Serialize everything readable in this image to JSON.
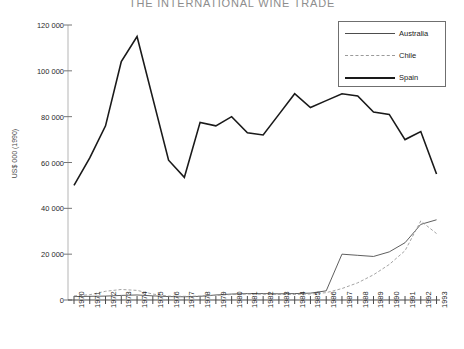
{
  "chart_data": {
    "type": "line",
    "title": "THE INTERNATIONAL WINE TRADE",
    "xlabel": "",
    "ylabel": "US$ 000 (1990)",
    "ylim": [
      0,
      120000
    ],
    "yticks": [
      0,
      20000,
      40000,
      60000,
      80000,
      100000,
      120000
    ],
    "ytick_labels": [
      "0",
      "20 000",
      "40 000",
      "60 000",
      "80 000",
      "100 000",
      "120 000"
    ],
    "grid": false,
    "legend_position": "top-right",
    "x": [
      1970,
      1971,
      1972,
      1973,
      1974,
      1975,
      1976,
      1977,
      1978,
      1979,
      1980,
      1981,
      1982,
      1983,
      1984,
      1985,
      1986,
      1987,
      1988,
      1989,
      1990,
      1991,
      1992,
      1993
    ],
    "xtick_labels": [
      "1970",
      "1971",
      "1972",
      "1973",
      "1974",
      "1975",
      "1976",
      "1977",
      "1978",
      "1979",
      "1980",
      "1981",
      "1982",
      "1983",
      "1984",
      "1985",
      "1986",
      "1987",
      "1988",
      "1989",
      "1990",
      "1991",
      "1992",
      "1993"
    ],
    "series": [
      {
        "name": "Australia",
        "style": "thin-solid",
        "color": "#4d4d4d",
        "values": [
          1500,
          1600,
          1700,
          2000,
          2200,
          1800,
          1500,
          1400,
          1600,
          2200,
          2600,
          2800,
          2800,
          2700,
          2800,
          3000,
          4000,
          20000,
          19500,
          19000,
          21000,
          25000,
          33000,
          35000
        ]
      },
      {
        "name": "Chile",
        "style": "dashed",
        "color": "#9a9a9a",
        "values": [
          1800,
          2300,
          3800,
          4600,
          4200,
          2600,
          1700,
          1600,
          1700,
          2000,
          2400,
          2600,
          2500,
          2400,
          2400,
          2600,
          3200,
          5000,
          7500,
          11000,
          15500,
          21500,
          34500,
          29000
        ]
      },
      {
        "name": "Spain",
        "style": "thick-solid",
        "color": "#1a1a1a",
        "values": [
          50000,
          62000,
          76000,
          104000,
          115000,
          88000,
          61000,
          53500,
          77500,
          76000,
          80000,
          73000,
          72000,
          81000,
          90000,
          84000,
          87000,
          90000,
          89000,
          82000,
          81000,
          70000,
          73500,
          55000
        ]
      }
    ]
  }
}
